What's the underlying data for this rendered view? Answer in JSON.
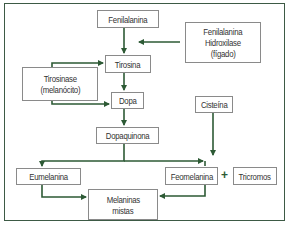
{
  "diagram": {
    "title": "",
    "colors": {
      "arrow": "#2d5a35",
      "frame": "#3d5a45",
      "box_border": "#8a8a8a",
      "text": "#333333"
    },
    "nodes": {
      "fenilalanina": {
        "lines": [
          "Fenilalanina"
        ]
      },
      "hidroxilase": {
        "lines": [
          "Fenilalanina",
          "Hidroxilase",
          "(fígado)"
        ]
      },
      "tirosina": {
        "lines": [
          "Tirosina"
        ]
      },
      "tirosinase": {
        "lines": [
          "Tirosinase",
          "(melanócito)"
        ]
      },
      "dopa": {
        "lines": [
          "Dopa"
        ]
      },
      "cisteina": {
        "lines": [
          "Cisteína"
        ]
      },
      "dopaquinona": {
        "lines": [
          "Dopaquinona"
        ]
      },
      "eumelanina": {
        "lines": [
          "Eumelanina"
        ]
      },
      "feomelanina": {
        "lines": [
          "Feomelanina"
        ]
      },
      "tricromos": {
        "lines": [
          "Tricromos"
        ]
      },
      "melaninas_mistas": {
        "lines": [
          "Melaninas",
          "mistas"
        ]
      }
    },
    "plus_sign": "+",
    "edges": [
      {
        "from": "Fenilalanina",
        "to": "Tirosina"
      },
      {
        "from": "Fenilalanina Hidroxilase (fígado)",
        "to": "Fenilalanina→Tirosina"
      },
      {
        "from": "Tirosinase (melanócito)",
        "to": "Tirosina"
      },
      {
        "from": "Tirosinase (melanócito)",
        "to": "Dopa"
      },
      {
        "from": "Tirosina",
        "to": "Dopa"
      },
      {
        "from": "Dopa",
        "to": "Dopaquinona"
      },
      {
        "from": "Dopaquinona",
        "to": "Eumelanina"
      },
      {
        "from": "Dopaquinona",
        "to": "Feomelanina"
      },
      {
        "from": "Cisteína",
        "to": "Feomelanina"
      },
      {
        "from": "Eumelanina",
        "to": "Melaninas mistas"
      },
      {
        "from": "Feomelanina",
        "to": "Melaninas mistas"
      }
    ]
  }
}
